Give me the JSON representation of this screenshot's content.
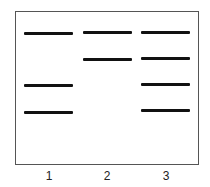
{
  "figure": {
    "type": "gel-electrophoresis",
    "lanes": [
      {
        "label": "1",
        "bands": [
          33,
          85,
          112
        ]
      },
      {
        "label": "2",
        "bands": [
          32,
          59
        ]
      },
      {
        "label": "3",
        "bands": [
          32,
          58,
          84,
          110
        ]
      }
    ],
    "colors": {
      "band": "#111111",
      "border": "#555555",
      "background": "#ffffff"
    }
  }
}
